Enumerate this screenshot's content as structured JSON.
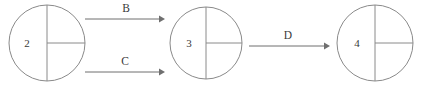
{
  "diagram": {
    "type": "state-transition-diagram",
    "background_color": "#ffffff",
    "stroke_color": "#8a8a8a",
    "edge_color": "#6f6f6f",
    "text_color": "#3a3a3a",
    "nodes": [
      {
        "id": "node-2",
        "label": "2",
        "cx": 47,
        "cy": 43,
        "r": 38,
        "label_x": 27,
        "label_y": 47,
        "dividers": "vertical-diameter-and-right-horizontal-radius"
      },
      {
        "id": "node-3",
        "label": "3",
        "cx": 206,
        "cy": 43,
        "r": 36,
        "label_x": 189,
        "label_y": 47,
        "dividers": "vertical-diameter-and-right-horizontal-radius"
      },
      {
        "id": "node-4",
        "label": "4",
        "cx": 375,
        "cy": 43,
        "r": 38,
        "label_x": 357,
        "label_y": 47,
        "dividers": "vertical-diameter-and-right-horizontal-radius"
      }
    ],
    "edges": [
      {
        "id": "edge-b",
        "label": "B",
        "from": "node-2",
        "to": "node-3",
        "x1": 85,
        "x2": 163,
        "y": 19,
        "label_x": 126,
        "label_y": 12
      },
      {
        "id": "edge-c",
        "label": "C",
        "from": "node-2",
        "to": "node-3",
        "x1": 85,
        "x2": 163,
        "y": 72,
        "label_x": 125,
        "label_y": 65
      },
      {
        "id": "edge-d",
        "label": "D",
        "from": "node-3",
        "to": "node-4",
        "x1": 249,
        "x2": 328,
        "y": 46,
        "label_x": 288,
        "label_y": 39
      }
    ]
  }
}
